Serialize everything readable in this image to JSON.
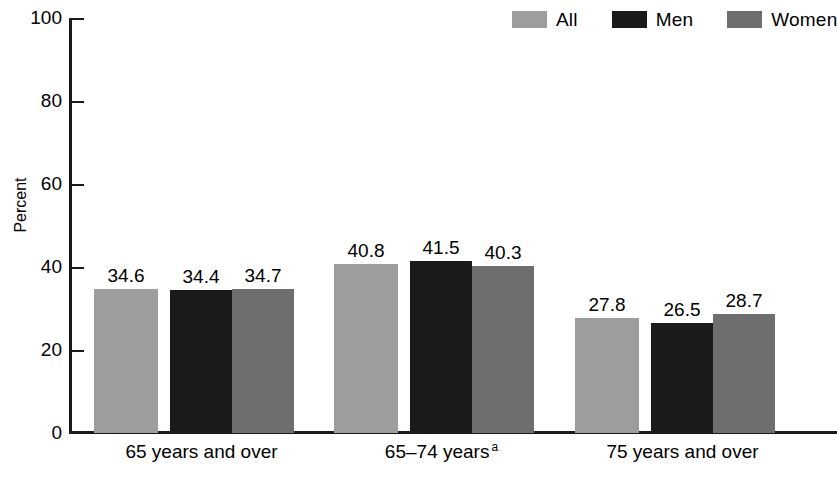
{
  "chart_data": {
    "type": "bar",
    "title": "",
    "subtitle": "",
    "xlabel": "",
    "ylabel": "Percent",
    "ylim": [
      0,
      100
    ],
    "yticks": [
      0,
      20,
      40,
      60,
      80,
      100
    ],
    "ytick_labels": [
      "0",
      "20",
      "40",
      "60",
      "80",
      "100"
    ],
    "grid": false,
    "legend_position": "top-right",
    "categories": [
      "65 years and over",
      "65–74 years",
      "75 years and over"
    ],
    "category_footnotes": [
      "",
      "a",
      ""
    ],
    "series": [
      {
        "name": "All",
        "color": "#9d9d9d",
        "values": [
          34.6,
          40.8,
          27.8
        ]
      },
      {
        "name": "Men",
        "color": "#1a1a1a",
        "values": [
          34.4,
          41.5,
          26.5
        ]
      },
      {
        "name": "Women",
        "color": "#6e6e6e",
        "values": [
          34.7,
          40.3,
          28.7
        ]
      }
    ],
    "value_labels": [
      [
        "34.6",
        "34.4",
        "34.7"
      ],
      [
        "40.8",
        "41.5",
        "40.3"
      ],
      [
        "27.8",
        "26.5",
        "28.7"
      ]
    ]
  },
  "legend": {
    "items": [
      {
        "label": "All",
        "swatch_color": "#9d9d9d"
      },
      {
        "label": "Men",
        "swatch_color": "#1a1a1a"
      },
      {
        "label": "Women",
        "swatch_color": "#6e6e6e"
      }
    ]
  },
  "axes": {
    "y_title": "Percent",
    "y_ticks": [
      "100",
      "80",
      "60",
      "40",
      "20",
      "0"
    ],
    "x_categories": [
      "65 years and over",
      "65–74 years",
      "75 years and over"
    ],
    "x_footnote_marker": "a"
  },
  "colors": {
    "axis": "#1a1a1a",
    "all": "#9d9d9d",
    "men": "#1a1a1a",
    "women": "#6e6e6e",
    "background": "#ffffff"
  }
}
